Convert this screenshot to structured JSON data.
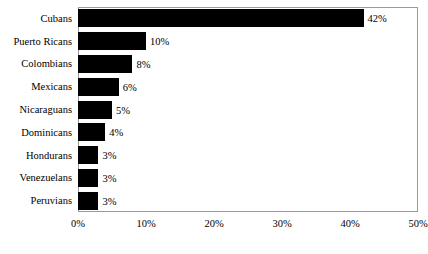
{
  "chart_data": {
    "type": "bar",
    "orientation": "horizontal",
    "title": "",
    "xlabel": "",
    "ylabel": "",
    "categories": [
      "Cubans",
      "Puerto Ricans",
      "Colombians",
      "Mexicans",
      "Nicaraguans",
      "Dominicans",
      "Hondurans",
      "Venezuelans",
      "Peruvians"
    ],
    "values": [
      42,
      10,
      8,
      6,
      5,
      4,
      3,
      3,
      3
    ],
    "value_labels": [
      "42%",
      "10%",
      "8%",
      "6%",
      "5%",
      "4%",
      "3%",
      "3%",
      "3%"
    ],
    "xlim": [
      0,
      50
    ],
    "xticks": [
      0,
      10,
      20,
      30,
      40,
      50
    ],
    "xtick_labels": [
      "0%",
      "10%",
      "20%",
      "30%",
      "40%",
      "50%"
    ],
    "grid": false,
    "legend": false,
    "bar_color": "#000000",
    "frame_color": "#9a9a9a",
    "background_color": "#ffffff"
  }
}
